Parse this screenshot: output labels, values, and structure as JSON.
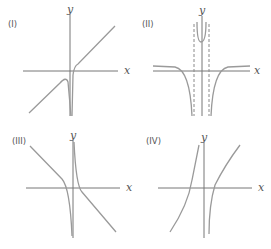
{
  "figure": {
    "panels": [
      {
        "id": "I",
        "label": "(I)",
        "x_axis_label": "x",
        "y_axis_label": "y",
        "description": "Curve with vertical asymptote at x=0 going to -infinity from both sides; oblique asymptote increasing line"
      },
      {
        "id": "II",
        "label": "(II)",
        "x_axis_label": "x",
        "y_axis_label": "y",
        "description": "Even function with two vertical asymptotes (dashed) near origin; approaches x-axis from below at far ends; goes up between asymptotes"
      },
      {
        "id": "III",
        "label": "(III)",
        "x_axis_label": "x",
        "y_axis_label": "y",
        "description": "Decreasing curve with vertical asymptote at x=0; left branch descends to -infinity, right branch descends from +infinity"
      },
      {
        "id": "IV",
        "label": "(IV)",
        "x_axis_label": "x",
        "y_axis_label": "y",
        "description": "Increasing curve with vertical asymptote at x=0; left branch rises to +infinity, right branch rises from -infinity"
      }
    ],
    "colors": {
      "axis": "#777777",
      "curve": "#9a9a9a",
      "text": "#555555"
    }
  }
}
